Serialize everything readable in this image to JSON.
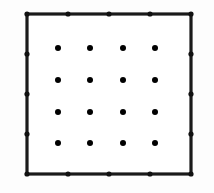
{
  "figure": {
    "title": "Square lattice with boundary nodes and interior dot grid",
    "canvas": {
      "width": 214,
      "height": 193,
      "background": "#fdfdfd"
    },
    "colors": {
      "stroke": "#1a1a1a",
      "node_fill": "#111111",
      "interior_fill": "#141414",
      "interior_fill_shown": "#000000",
      "background": "#fdfdfd",
      "panel_fill": "#ffffff"
    },
    "square": {
      "name": "outer-square",
      "x1": 27,
      "y1": 14,
      "x2": 191,
      "y2": 174,
      "stroke_width": 3.2,
      "fill": "#ffffff"
    },
    "boundary": {
      "nodes_per_edge": 5,
      "node_radius": 2.6,
      "total_nodes": 16,
      "top": [
        {
          "x": 27,
          "y": 14
        },
        {
          "x": 68,
          "y": 14
        },
        {
          "x": 109,
          "y": 14
        },
        {
          "x": 150,
          "y": 14
        },
        {
          "x": 191,
          "y": 14
        }
      ],
      "right": [
        {
          "x": 191,
          "y": 14
        },
        {
          "x": 191,
          "y": 54
        },
        {
          "x": 191,
          "y": 94
        },
        {
          "x": 191,
          "y": 134
        },
        {
          "x": 191,
          "y": 174
        }
      ],
      "bottom": [
        {
          "x": 27,
          "y": 174
        },
        {
          "x": 68,
          "y": 174
        },
        {
          "x": 109,
          "y": 174
        },
        {
          "x": 150,
          "y": 174
        },
        {
          "x": 191,
          "y": 174
        }
      ],
      "left": [
        {
          "x": 27,
          "y": 14
        },
        {
          "x": 27,
          "y": 54
        },
        {
          "x": 27,
          "y": 94
        },
        {
          "x": 27,
          "y": 134
        },
        {
          "x": 27,
          "y": 174
        }
      ]
    },
    "interior_grid": {
      "rows": 4,
      "cols": 4,
      "count": 16,
      "dot_radius": 3.0,
      "origin_x": 58,
      "origin_y": 48,
      "spacing_x": 32.5,
      "spacing_y": 31.8,
      "dots": [
        {
          "x": 58,
          "y": 48
        },
        {
          "x": 90,
          "y": 48
        },
        {
          "x": 123,
          "y": 48
        },
        {
          "x": 155,
          "y": 48
        },
        {
          "x": 58,
          "y": 80
        },
        {
          "x": 90,
          "y": 80
        },
        {
          "x": 123,
          "y": 80
        },
        {
          "x": 155,
          "y": 80
        },
        {
          "x": 58,
          "y": 112
        },
        {
          "x": 90,
          "y": 112
        },
        {
          "x": 123,
          "y": 112
        },
        {
          "x": 155,
          "y": 112
        },
        {
          "x": 58,
          "y": 143
        },
        {
          "x": 90,
          "y": 143
        },
        {
          "x": 123,
          "y": 143
        },
        {
          "x": 155,
          "y": 143
        }
      ]
    }
  }
}
